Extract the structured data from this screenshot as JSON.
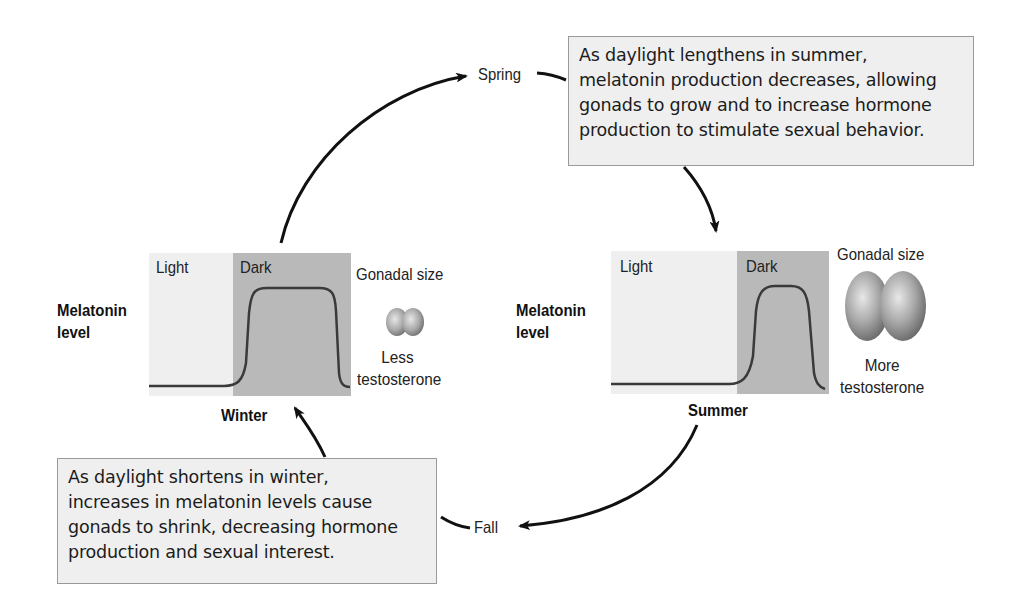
{
  "diagram": {
    "seasons": {
      "spring": "Spring",
      "summer": "Summer",
      "fall": "Fall",
      "winter": "Winter"
    },
    "summer_note": {
      "lines": [
        "As daylight lengthens in summer,",
        "melatonin production decreases, allowing",
        "gonads to grow and to increase hormone",
        "production to stimulate sexual behavior."
      ]
    },
    "winter_note": {
      "lines": [
        "As daylight shortens in winter,",
        "increases in melatonin levels cause",
        "gonads to shrink, decreasing hormone",
        "production and sexual interest."
      ]
    },
    "winter_panel": {
      "y_label_line1": "Melatonin",
      "y_label_line2": "level",
      "light_label": "Light",
      "dark_label": "Dark",
      "gonad_label": "Gonadal size",
      "hormone_line1": "Less",
      "hormone_line2": "testosterone",
      "season_label": "Winter",
      "gonad_size": "small"
    },
    "summer_panel": {
      "y_label_line1": "Melatonin",
      "y_label_line2": "level",
      "light_label": "Light",
      "dark_label": "Dark",
      "gonad_label": "Gonadal size",
      "hormone_line1": "More",
      "hormone_line2": "testosterone",
      "season_label": "Summer",
      "gonad_size": "large"
    },
    "colors": {
      "light_period": "#efefef",
      "dark_period": "#b9b9b9",
      "curve": "#3a3a3a",
      "note_bg": "#efefef",
      "note_border": "#9a9a9a",
      "arrow": "#111111"
    }
  }
}
